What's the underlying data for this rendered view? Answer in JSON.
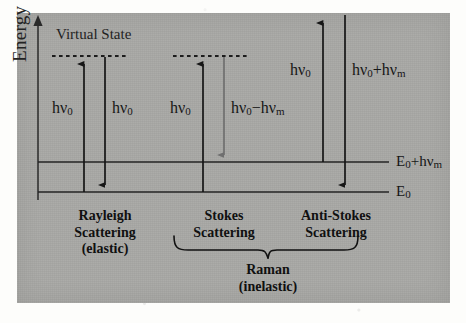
{
  "figure": {
    "type": "energy-level-diagram",
    "panel_background": "#a9a9a6",
    "ink_color": "#161616"
  },
  "axis": {
    "label": "Energy",
    "direction": "up",
    "has_arrowhead": true
  },
  "levels": {
    "virtual_state": {
      "label": "Virtual State",
      "style": "dashed",
      "segments": 2
    },
    "excited_vibrational": {
      "label": "E₀+hν",
      "label_sub": "m",
      "full_label": "E0+hvm"
    },
    "ground": {
      "label": "E₀",
      "full_label": "E0"
    }
  },
  "transitions": [
    {
      "name": "rayleigh-absorption",
      "label": "hν",
      "sub": "0",
      "direction": "up",
      "color": "#161616"
    },
    {
      "name": "rayleigh-emission",
      "label": "hν",
      "sub": "0",
      "direction": "down",
      "color": "#161616"
    },
    {
      "name": "stokes-absorption",
      "label": "hν",
      "sub": "0",
      "direction": "up",
      "color": "#161616"
    },
    {
      "name": "stokes-emission",
      "label": "hν₀−hν",
      "sub": "m",
      "direction": "down",
      "color": "#6f6f6f"
    },
    {
      "name": "antistokes-absorption",
      "label": "hν",
      "sub": "0",
      "direction": "up",
      "color": "#161616"
    },
    {
      "name": "antistokes-emission",
      "label": "hν₀+hν",
      "sub": "m",
      "direction": "down",
      "color": "#161616"
    }
  ],
  "labels": {
    "hv0_rayleigh_up": {
      "base": "hν",
      "sub": "0"
    },
    "hv0_rayleigh_down": {
      "base": "hν",
      "sub": "0"
    },
    "hv0_stokes_up": {
      "base": "hν",
      "sub": "0"
    },
    "hv0_minus_hvm": {
      "base": "hν",
      "sub": "0",
      "mid": "−hν",
      "sub2": "m"
    },
    "hv0_antistokes_up": {
      "base": "hν",
      "sub": "0"
    },
    "hv0_plus_hvm": {
      "base": "hν",
      "sub": "0",
      "mid": "+hν",
      "sub2": "m"
    },
    "E0_plus_hvm": {
      "base": "E",
      "sub": "0",
      "mid": "+hν",
      "sub2": "m"
    },
    "E0": {
      "base": "E",
      "sub": "0"
    }
  },
  "categories": [
    {
      "name": "rayleigh",
      "line1": "Rayleigh",
      "line2": "Scattering",
      "line3": "(elastic)"
    },
    {
      "name": "stokes",
      "line1": "Stokes",
      "line2": "Scattering",
      "line3": ""
    },
    {
      "name": "anti-stokes",
      "line1": "Anti-Stokes",
      "line2": "Scattering",
      "line3": ""
    }
  ],
  "group": {
    "name": "raman",
    "line1": "Raman",
    "line2": "(inelastic)",
    "brace_covers": [
      "stokes",
      "anti-stokes"
    ]
  }
}
